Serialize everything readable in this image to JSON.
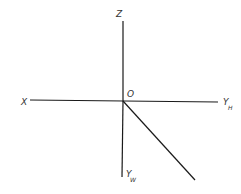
{
  "diagram": {
    "type": "projection-axes",
    "origin": {
      "x": 123,
      "y": 101
    },
    "labels": {
      "z": "Z",
      "origin": "O",
      "x": "X",
      "yh_main": "Y",
      "yh_sub": "H",
      "yw_main": "Y",
      "yw_sub": "W"
    },
    "lines": [
      {
        "name": "z-axis",
        "x1": 123,
        "y1": 21,
        "x2": 123,
        "y2": 101
      },
      {
        "name": "x-yh-axis",
        "x1": 30,
        "y1": 100,
        "x2": 218,
        "y2": 102
      },
      {
        "name": "yw-axis",
        "x1": 123,
        "y1": 101,
        "x2": 122,
        "y2": 177
      },
      {
        "name": "diagonal-45",
        "x1": 123,
        "y1": 101,
        "x2": 195,
        "y2": 180
      }
    ],
    "stroke_color": "#1a1a1a",
    "label_color": "#333333"
  }
}
